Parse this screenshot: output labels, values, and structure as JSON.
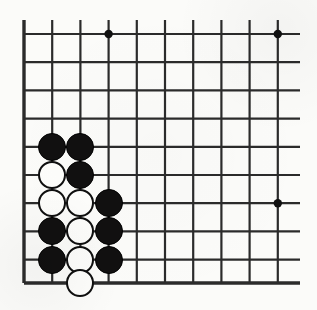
{
  "figure": {
    "kind": "go-board-diagram",
    "width": 317,
    "height": 310,
    "background_color": "#fbfbf9"
  },
  "board": {
    "origin_x": 24,
    "origin_y": 34,
    "cell_size": 28.2,
    "columns": 10,
    "rows": 9,
    "line_color": "#2b2b2b",
    "line_width": 2.2,
    "edge_line_width": 3.4,
    "edges": {
      "left": true,
      "bottom": true,
      "top": false,
      "right": false
    },
    "x_lines": [
      24,
      52.2,
      80.4,
      108.6,
      136.8,
      165,
      193.2,
      221.4,
      249.6,
      277.8
    ],
    "y_lines": [
      34,
      62.2,
      90.4,
      118.6,
      146.8,
      175,
      203.2,
      231.4,
      259.6,
      283
    ],
    "bottom_edge_y": 283,
    "right_extent_x": 300,
    "top_extent_y": 20,
    "star_points": [
      {
        "name": "star-point-top",
        "x": 108.6,
        "y": 34,
        "radius": 4.2
      },
      {
        "name": "star-point-top-right",
        "x": 277.8,
        "y": 34,
        "radius": 4.2
      },
      {
        "name": "star-point-right",
        "x": 277.8,
        "y": 203.2,
        "radius": 4.2
      }
    ],
    "star_point_color": "#111111"
  },
  "stones": {
    "diameter": 28,
    "black_color": "#111010",
    "white_color": "#fdfdfb",
    "white_border_color": "#0f0f0f",
    "black_count": 9,
    "white_count": 7,
    "items": [
      {
        "name": "stone-black-c2r5",
        "color": "black",
        "x": 52.2,
        "y": 146.8
      },
      {
        "name": "stone-black-c3r5",
        "color": "black",
        "x": 80.4,
        "y": 146.8
      },
      {
        "name": "stone-white-c2r6",
        "color": "white",
        "x": 52.2,
        "y": 175
      },
      {
        "name": "stone-black-c3r6",
        "color": "black",
        "x": 80.4,
        "y": 175
      },
      {
        "name": "stone-white-c2r7",
        "color": "white",
        "x": 52.2,
        "y": 203.2
      },
      {
        "name": "stone-white-c3r7",
        "color": "white",
        "x": 80.4,
        "y": 203.2
      },
      {
        "name": "stone-black-c4r7",
        "color": "black",
        "x": 108.6,
        "y": 203.2
      },
      {
        "name": "stone-black-c2r8",
        "color": "black",
        "x": 52.2,
        "y": 231.4
      },
      {
        "name": "stone-white-c3r8",
        "color": "white",
        "x": 80.4,
        "y": 231.4
      },
      {
        "name": "stone-black-c4r8",
        "color": "black",
        "x": 108.6,
        "y": 231.4
      },
      {
        "name": "stone-black-c2r9",
        "color": "black",
        "x": 52.2,
        "y": 259.6
      },
      {
        "name": "stone-white-c3r9",
        "color": "white",
        "x": 80.4,
        "y": 259.6
      },
      {
        "name": "stone-black-c4r9",
        "color": "black",
        "x": 108.6,
        "y": 259.6
      },
      {
        "name": "stone-white-c3r10-edge",
        "color": "white",
        "x": 80.4,
        "y": 283
      }
    ]
  }
}
